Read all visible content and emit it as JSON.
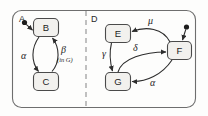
{
  "diagram": {
    "outer_region": {
      "name": "outer-rounded-region"
    },
    "divider": {
      "name": "dashed-divider",
      "style": "dashed"
    },
    "regions": [
      {
        "label": "A",
        "states": [
          {
            "id": "B",
            "label": "B",
            "initial": true
          },
          {
            "id": "C",
            "label": "C",
            "initial": false
          }
        ],
        "transitions": [
          {
            "from": "B",
            "to": "C",
            "label": "α",
            "label_sub": ""
          },
          {
            "from": "C",
            "to": "B",
            "label": "β",
            "label_sub": "(in G)"
          }
        ]
      },
      {
        "label": "D",
        "states": [
          {
            "id": "E",
            "label": "E",
            "initial": false
          },
          {
            "id": "F",
            "label": "F",
            "initial": true
          },
          {
            "id": "G",
            "label": "G",
            "initial": false
          }
        ],
        "transitions": [
          {
            "from": "F",
            "to": "E",
            "label": "μ",
            "label_sub": ""
          },
          {
            "from": "E",
            "to": "G",
            "label": "γ",
            "label_sub": ""
          },
          {
            "from": "G",
            "to": "F",
            "label": "δ",
            "label_sub": ""
          },
          {
            "from": "F",
            "to": "G",
            "label": "α",
            "label_sub": ""
          }
        ]
      }
    ],
    "colors": {
      "stroke": "#3a3a3a",
      "state_fill": "#f2f1ee",
      "background": "#fdfdfc",
      "divider": "#9a9a9a"
    }
  }
}
